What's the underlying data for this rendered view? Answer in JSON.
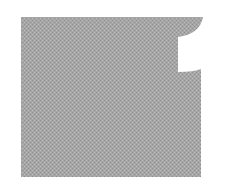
{
  "figure": {
    "fill_color": "#a6a6a6",
    "dot_color": "#8f8f8f",
    "light_dot_color": "#bcbcbc",
    "background_color": "#ffffff"
  }
}
